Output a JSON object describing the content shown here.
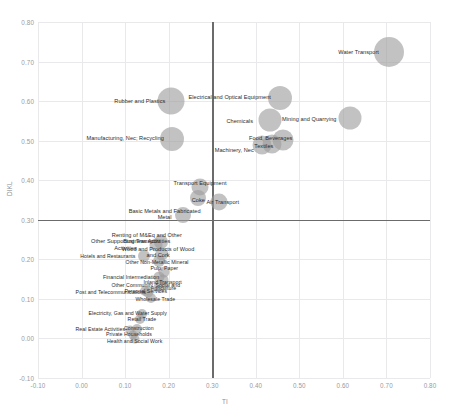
{
  "chart_data": {
    "type": "scatter",
    "title": "",
    "xlabel": "TI",
    "ylabel": "DIKL",
    "xlim": [
      -0.1,
      0.8
    ],
    "ylim": [
      -0.1,
      0.8
    ],
    "xticks": [
      "-0.10",
      "0.00",
      "0.10",
      "0.20",
      "0.30",
      "0.40",
      "0.50",
      "0.60",
      "0.70",
      "0.80"
    ],
    "yticks": [
      "-0.10",
      "0.00",
      "0.10",
      "0.20",
      "0.30",
      "0.40",
      "0.50",
      "0.60",
      "0.70",
      "0.80"
    ],
    "grid": true,
    "legend": "none",
    "reference_lines": {
      "x": 0.3,
      "y": 0.3
    },
    "bubble_color": "#9d9d9d",
    "points": [
      {
        "label": "Water Transport",
        "x": 0.705,
        "y": 0.725,
        "size": 30,
        "label_dx": -30,
        "label_dy": 0
      },
      {
        "label": "Rubber and Plastics",
        "x": 0.205,
        "y": 0.6,
        "size": 27,
        "label_dx": -31,
        "label_dy": 0
      },
      {
        "label": "Electrical and Optical Equipment",
        "x": 0.455,
        "y": 0.608,
        "size": 24,
        "label_dx": -50,
        "label_dy": -1
      },
      {
        "label": "Mining and Quarrying",
        "x": 0.617,
        "y": 0.558,
        "size": 23,
        "label_dx": -41,
        "label_dy": 1
      },
      {
        "label": "Chemicals",
        "x": 0.432,
        "y": 0.553,
        "size": 23,
        "label_dx": -30,
        "label_dy": 1
      },
      {
        "label": "Manufacturing, Nec; Recycling",
        "x": 0.208,
        "y": 0.505,
        "size": 24,
        "label_dx": -47,
        "label_dy": -1
      },
      {
        "label": "Food, Beverages",
        "x": 0.462,
        "y": 0.502,
        "size": 21,
        "label_dx": -12,
        "label_dy": -2
      },
      {
        "label": "Textiles",
        "x": 0.437,
        "y": 0.492,
        "size": 19,
        "label_dx": -8,
        "label_dy": 2
      },
      {
        "label": "Machinery, Nec",
        "x": 0.415,
        "y": 0.488,
        "size": 19,
        "label_dx": -28,
        "label_dy": 5
      },
      {
        "label": "Transport Equipment",
        "x": 0.272,
        "y": 0.382,
        "size": 17,
        "label_dx": 0,
        "label_dy": -4
      },
      {
        "label": "Coke",
        "x": 0.268,
        "y": 0.355,
        "size": 16,
        "label_dx": 0,
        "label_dy": 2
      },
      {
        "label": "Air Transport",
        "x": 0.315,
        "y": 0.345,
        "size": 17,
        "label_dx": 4,
        "label_dy": 0
      },
      {
        "label": "Basic Metals and Fabricated\nMetal",
        "x": 0.232,
        "y": 0.312,
        "size": 16,
        "label_dx": -18,
        "label_dy": -1
      },
      {
        "label": "Renting of M&Eq and Other\nBusiness Activities",
        "x": 0.182,
        "y": 0.245,
        "size": 14,
        "label_dx": -14,
        "label_dy": -4
      },
      {
        "label": "Other Supporting Transport\nActivities",
        "x": 0.17,
        "y": 0.235,
        "size": 13,
        "label_dx": -30,
        "label_dy": -1
      },
      {
        "label": "Wood and Products of Wood\nand Cork",
        "x": 0.185,
        "y": 0.213,
        "size": 13,
        "label_dx": -4,
        "label_dy": -2
      },
      {
        "label": "Hotels and Restaurants",
        "x": 0.143,
        "y": 0.208,
        "size": 12,
        "label_dx": -36,
        "label_dy": 1
      },
      {
        "label": "Other Non-Metallic Mineral",
        "x": 0.178,
        "y": 0.196,
        "size": 12,
        "label_dx": -2,
        "label_dy": 2
      },
      {
        "label": "Pulp, Paper",
        "x": 0.19,
        "y": 0.168,
        "size": 11,
        "label_dx": 0,
        "label_dy": -3
      },
      {
        "label": "Financial Intermediation",
        "x": 0.178,
        "y": 0.156,
        "size": 11,
        "label_dx": -28,
        "label_dy": 1
      },
      {
        "label": "Inland Transport",
        "x": 0.186,
        "y": 0.148,
        "size": 11,
        "label_dx": 0,
        "label_dy": 3
      },
      {
        "label": "Agriculture",
        "x": 0.179,
        "y": 0.133,
        "size": 12,
        "label_dx": 4,
        "label_dy": 3
      },
      {
        "label": "Other Community, Social and\nPersonal Services",
        "x": 0.152,
        "y": 0.118,
        "size": 11,
        "label_dx": -2,
        "label_dy": -3
      },
      {
        "label": "Post and Telecommunications",
        "x": 0.145,
        "y": 0.12,
        "size": 10,
        "label_dx": -34,
        "label_dy": 2
      },
      {
        "label": "Wholesale Trade",
        "x": 0.16,
        "y": 0.102,
        "size": 10,
        "label_dx": 4,
        "label_dy": 2
      },
      {
        "label": "Electricity, Gas and Water Supply",
        "x": 0.138,
        "y": 0.063,
        "size": 10,
        "label_dx": -14,
        "label_dy": 0
      },
      {
        "label": "Retail Trade",
        "x": 0.134,
        "y": 0.048,
        "size": 10,
        "label_dx": 2,
        "label_dy": 1
      },
      {
        "label": "Construction",
        "x": 0.127,
        "y": 0.025,
        "size": 10,
        "label_dx": 2,
        "label_dy": 0
      },
      {
        "label": "Real Estate Activities",
        "x": 0.112,
        "y": 0.022,
        "size": 9,
        "label_dx": -30,
        "label_dy": 0
      },
      {
        "label": "Private Households",
        "x": 0.118,
        "y": 0.008,
        "size": 9,
        "label_dx": -4,
        "label_dy": 0
      },
      {
        "label": "Health and Social Work",
        "x": 0.122,
        "y": -0.002,
        "size": 9,
        "label_dx": 0,
        "label_dy": 3
      }
    ]
  }
}
